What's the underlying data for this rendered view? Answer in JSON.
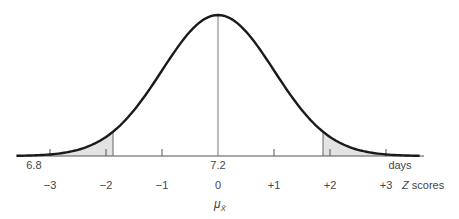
{
  "chart_data": {
    "type": "area",
    "title": "",
    "mean": 7.2,
    "xlabel": "days",
    "zlabel": "Z scores",
    "mu_label": "μ",
    "mu_subscript": "X̄",
    "day_ticks": [
      {
        "label": "6.8",
        "z": -3.6
      },
      {
        "label": "7.2",
        "z": 0
      }
    ],
    "z_ticks": [
      {
        "label": "−3",
        "z": -3
      },
      {
        "label": "−2",
        "z": -2
      },
      {
        "label": "−1",
        "z": -1
      },
      {
        "label": "0",
        "z": 0
      },
      {
        "label": "+1",
        "z": 1
      },
      {
        "label": "+2",
        "z": 2
      },
      {
        "label": "+3",
        "z": 3
      }
    ],
    "shaded_regions": [
      {
        "from_z": -3.6,
        "to_z": -1.875,
        "side": "left"
      },
      {
        "from_z": 1.875,
        "to_z": 3.6,
        "side": "right"
      }
    ],
    "colors": {
      "curve": "#1a1a1a",
      "shade": "#e3e3e3",
      "axis": "#555555",
      "center_line": "#777777"
    }
  },
  "labels": {
    "days_unit": "days",
    "left_day": "6.8",
    "center_day": "7.2",
    "z_scores_z": "Z",
    "z_scores_text": " scores",
    "mu": "μ",
    "mu_sub": "X̄"
  }
}
